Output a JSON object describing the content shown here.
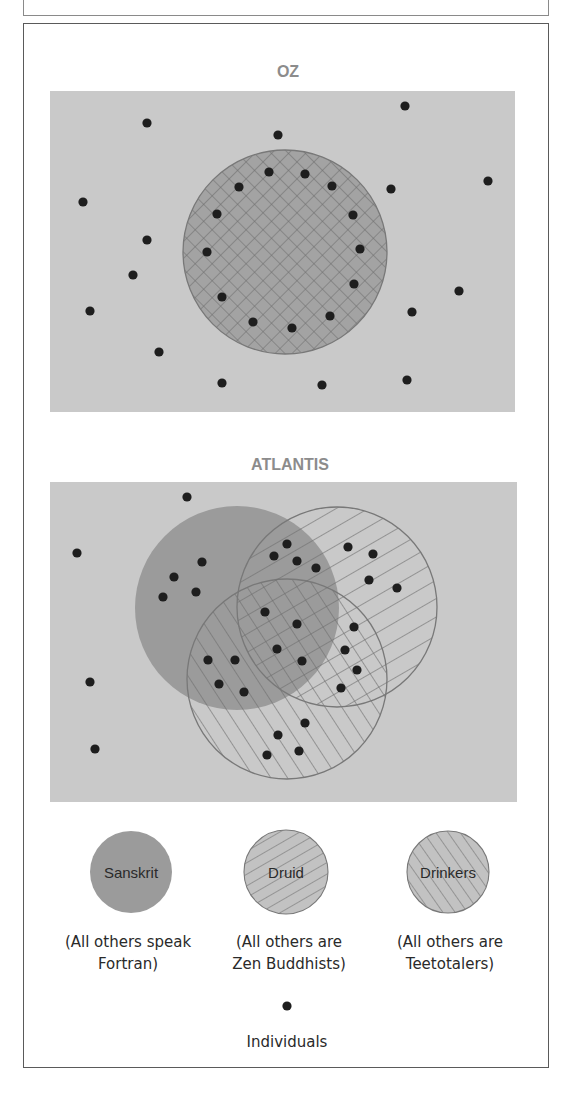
{
  "figure": {
    "colors": {
      "panel_bg": "#c9c9c9",
      "sanskrit_fill": "#9b9b9b",
      "oz_circle_fill": "#a3a3a3",
      "hatch_line": "#6e6e6e",
      "circle_outline": "#787878",
      "dot": "#1e1e1e",
      "title": "#8c8c8c",
      "legend_hatch_fill": "#c2c2c2"
    },
    "panels": [
      {
        "id": "oz",
        "title": "OZ",
        "title_pos": [
          288,
          77
        ],
        "rect": [
          50,
          91,
          465,
          321
        ],
        "circles": [
          {
            "name": "oz-circle",
            "pattern": "crosshatch",
            "cx": 285,
            "cy": 252,
            "r": 102
          }
        ],
        "dots": [
          [
            147,
            123
          ],
          [
            278,
            135
          ],
          [
            405,
            106
          ],
          [
            488,
            181
          ],
          [
            391,
            189
          ],
          [
            83,
            202
          ],
          [
            147,
            240
          ],
          [
            133,
            275
          ],
          [
            90,
            311
          ],
          [
            459,
            291
          ],
          [
            412,
            312
          ],
          [
            159,
            352
          ],
          [
            222,
            383
          ],
          [
            322,
            385
          ],
          [
            407,
            380
          ],
          [
            269,
            172
          ],
          [
            305,
            174
          ],
          [
            239,
            187
          ],
          [
            332,
            186
          ],
          [
            217,
            214
          ],
          [
            353,
            215
          ],
          [
            207,
            252
          ],
          [
            360,
            249
          ],
          [
            354,
            284
          ],
          [
            222,
            297
          ],
          [
            330,
            316
          ],
          [
            253,
            322
          ],
          [
            292,
            328
          ]
        ]
      },
      {
        "id": "atlantis",
        "title": "ATLANTIS",
        "title_pos": [
          290,
          470
        ],
        "rect": [
          50,
          482,
          467,
          320
        ],
        "circles": [
          {
            "name": "sanskrit-circle",
            "pattern": "solid",
            "cx": 237,
            "cy": 608,
            "r": 102
          },
          {
            "name": "drinkers-circle",
            "pattern": "hatch-down",
            "cx": 287,
            "cy": 679,
            "r": 100
          },
          {
            "name": "druid-circle",
            "pattern": "hatch-up",
            "cx": 337,
            "cy": 607,
            "r": 100
          }
        ],
        "dots": [
          [
            187,
            497
          ],
          [
            77,
            553
          ],
          [
            90,
            682
          ],
          [
            95,
            749
          ],
          [
            202,
            562
          ],
          [
            174,
            577
          ],
          [
            196,
            592
          ],
          [
            163,
            597
          ],
          [
            287,
            544
          ],
          [
            274,
            556
          ],
          [
            297,
            561
          ],
          [
            316,
            568
          ],
          [
            348,
            547
          ],
          [
            373,
            554
          ],
          [
            369,
            580
          ],
          [
            397,
            588
          ],
          [
            265,
            612
          ],
          [
            297,
            624
          ],
          [
            354,
            627
          ],
          [
            277,
            649
          ],
          [
            345,
            650
          ],
          [
            302,
            661
          ],
          [
            357,
            670
          ],
          [
            208,
            660
          ],
          [
            235,
            660
          ],
          [
            219,
            684
          ],
          [
            244,
            692
          ],
          [
            341,
            688
          ],
          [
            305,
            723
          ],
          [
            278,
            735
          ],
          [
            299,
            751
          ],
          [
            267,
            755
          ]
        ]
      }
    ],
    "legend": {
      "items": [
        {
          "name": "sanskrit",
          "label": "Sanskrit",
          "pattern": "solid",
          "cx": 131,
          "cy": 872,
          "r": 41,
          "caption": [
            "(All others speak",
            "Fortran)"
          ],
          "caption_x": 128
        },
        {
          "name": "druid",
          "label": "Druid",
          "pattern": "hatch-up",
          "cx": 286,
          "cy": 872,
          "r": 42,
          "caption": [
            "(All others are",
            "Zen Buddhists)"
          ],
          "caption_x": 289
        },
        {
          "name": "drinkers",
          "label": "Drinkers",
          "pattern": "hatch-down",
          "cx": 448,
          "cy": 872,
          "r": 41,
          "caption": [
            "(All others are",
            "Teetotalers)"
          ],
          "caption_x": 450
        }
      ],
      "caption_y": [
        947,
        969
      ],
      "individual": {
        "label": "Individuals",
        "dot": [
          287,
          1006
        ],
        "label_y": 1047
      }
    }
  }
}
